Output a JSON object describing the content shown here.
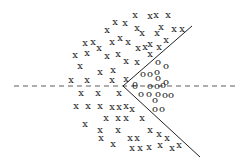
{
  "diagram": {
    "boundary": {
      "vertex": [
        123,
        86
      ],
      "upper_end": [
        192,
        26
      ],
      "lower_end": [
        200,
        157
      ]
    },
    "axis": {
      "y": 86,
      "x_start": 14,
      "x_end": 238
    },
    "x_label": "x",
    "o_label": "o",
    "theta_label": "θ",
    "x_points": [
      [
        135,
        15
      ],
      [
        150,
        16
      ],
      [
        156,
        15
      ],
      [
        168,
        15
      ],
      [
        107,
        30
      ],
      [
        115,
        22
      ],
      [
        125,
        23
      ],
      [
        137,
        28
      ],
      [
        142,
        33
      ],
      [
        157,
        33
      ],
      [
        161,
        27
      ],
      [
        174,
        29
      ],
      [
        182,
        29
      ],
      [
        85,
        43
      ],
      [
        93,
        42
      ],
      [
        99,
        48
      ],
      [
        112,
        42
      ],
      [
        120,
        38
      ],
      [
        128,
        42
      ],
      [
        138,
        48
      ],
      [
        145,
        47
      ],
      [
        150,
        44
      ],
      [
        159,
        47
      ],
      [
        166,
        40
      ],
      [
        75,
        55
      ],
      [
        87,
        53
      ],
      [
        107,
        56
      ],
      [
        118,
        54
      ],
      [
        126,
        61
      ],
      [
        137,
        62
      ],
      [
        150,
        54
      ],
      [
        80,
        66
      ],
      [
        100,
        72
      ],
      [
        113,
        70
      ],
      [
        71,
        80
      ],
      [
        87,
        80
      ],
      [
        112,
        80
      ],
      [
        126,
        79
      ],
      [
        81,
        93
      ],
      [
        98,
        93
      ],
      [
        119,
        93
      ],
      [
        76,
        106
      ],
      [
        88,
        106
      ],
      [
        100,
        106
      ],
      [
        112,
        107
      ],
      [
        119,
        107
      ],
      [
        126,
        106
      ],
      [
        132,
        109
      ],
      [
        106,
        118
      ],
      [
        118,
        118
      ],
      [
        126,
        118
      ],
      [
        142,
        118
      ],
      [
        85,
        124
      ],
      [
        100,
        130
      ],
      [
        101,
        138
      ],
      [
        118,
        130
      ],
      [
        113,
        144
      ],
      [
        130,
        138
      ],
      [
        137,
        138
      ],
      [
        150,
        130
      ],
      [
        159,
        134
      ],
      [
        167,
        138
      ],
      [
        132,
        148
      ],
      [
        140,
        148
      ],
      [
        149,
        147
      ],
      [
        160,
        145
      ],
      [
        172,
        148
      ],
      [
        179,
        145
      ]
    ],
    "o_points": [
      [
        158,
        62
      ],
      [
        166,
        66
      ],
      [
        143,
        74
      ],
      [
        150,
        74
      ],
      [
        157,
        72
      ],
      [
        158,
        78
      ],
      [
        166,
        82
      ],
      [
        150,
        86
      ],
      [
        157,
        86
      ],
      [
        163,
        85
      ],
      [
        141,
        94
      ],
      [
        149,
        94
      ],
      [
        158,
        94
      ],
      [
        165,
        95
      ],
      [
        171,
        95
      ],
      [
        155,
        100
      ],
      [
        155,
        109
      ],
      [
        162,
        109
      ]
    ],
    "theta_points": [
      [
        135,
        86
      ]
    ]
  }
}
